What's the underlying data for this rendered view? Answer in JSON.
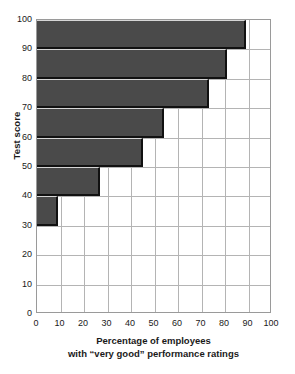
{
  "chart_data": {
    "type": "bar",
    "orientation": "horizontal",
    "title": "",
    "xlabel": "Percentage of employees with \"very good\" performance ratings",
    "xlabel_lines": [
      "Percentage of employees",
      "with “very good” performance ratings"
    ],
    "ylabel": "Test score",
    "xlim": [
      0,
      100
    ],
    "ylim": [
      0,
      100
    ],
    "xticks": [
      0,
      10,
      20,
      30,
      40,
      50,
      60,
      70,
      80,
      90,
      100
    ],
    "yticks": [
      0,
      10,
      20,
      30,
      40,
      50,
      60,
      70,
      80,
      90,
      100
    ],
    "grid": true,
    "legend": null,
    "bin_edges": [
      30,
      40,
      50,
      60,
      70,
      80,
      90,
      100
    ],
    "categories": [
      "30–40",
      "40–50",
      "50–60",
      "60–70",
      "70–80",
      "80–90",
      "90–100"
    ],
    "values": [
      9,
      27,
      45,
      54,
      73,
      81,
      89
    ],
    "bars": [
      {
        "y_low": 90,
        "y_high": 100,
        "value": 89
      },
      {
        "y_low": 80,
        "y_high": 90,
        "value": 81
      },
      {
        "y_low": 70,
        "y_high": 80,
        "value": 73
      },
      {
        "y_low": 60,
        "y_high": 70,
        "value": 54
      },
      {
        "y_low": 50,
        "y_high": 60,
        "value": 45
      },
      {
        "y_low": 40,
        "y_high": 50,
        "value": 27
      },
      {
        "y_low": 30,
        "y_high": 40,
        "value": 9
      }
    ],
    "colors": {
      "bar_fill": "#4a4a4a",
      "bar_shadow": "#111111",
      "bar_highlight": "#d6d6d6",
      "grid": "#b4b4b4",
      "frame": "#9a9a9a",
      "background": "#ffffff",
      "text": "#1a1a1a"
    }
  }
}
